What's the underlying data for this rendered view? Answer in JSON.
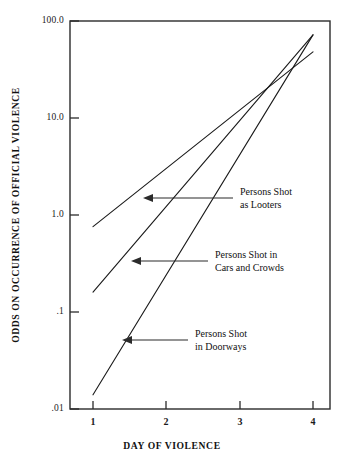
{
  "chart_data": {
    "type": "line",
    "title": "",
    "xlabel": "DAY OF VIOLENCE",
    "ylabel": "ODDS ON OCCURRENCE OF OFFICIAL VIOLENCE",
    "yscale": "log",
    "ylim": [
      0.01,
      100.0
    ],
    "xlim": [
      0.72,
      4.28
    ],
    "grid": false,
    "legend_position": "inline-annotations",
    "x": [
      1,
      2,
      3,
      4
    ],
    "xticks": [
      "1",
      "2",
      "3",
      "4"
    ],
    "yticks": [
      "100.0",
      "10.0",
      "1.0",
      ".1",
      ".01"
    ],
    "ytick_values": [
      100.0,
      10.0,
      1.0,
      0.1,
      0.01
    ],
    "series": [
      {
        "name": "Persons Shot as Looters",
        "x": [
          1,
          4
        ],
        "values": [
          0.76,
          48.0
        ]
      },
      {
        "name": "Persons Shot in Cars and Crowds",
        "x": [
          1,
          4
        ],
        "values": [
          0.16,
          72.0
        ]
      },
      {
        "name": "Persons Shot in Doorways",
        "x": [
          1,
          4
        ],
        "values": [
          0.014,
          72.0
        ]
      }
    ],
    "annotations": [
      {
        "label_line1": "Persons Shot",
        "label_line2": "as Looters",
        "target_series": "Persons Shot as Looters"
      },
      {
        "label_line1": "Persons Shot in",
        "label_line2": "Cars and Crowds",
        "target_series": "Persons Shot in Cars and Crowds"
      },
      {
        "label_line1": "Persons Shot",
        "label_line2": "in Doorways",
        "target_series": "Persons Shot in Doorways"
      }
    ]
  },
  "axes": {
    "y_title": "ODDS ON OCCURRENCE OF OFFICIAL VIOLENCE",
    "x_title": "DAY OF VIOLENCE",
    "y_labels": [
      "100.0",
      "10.0",
      "1.0",
      ".1",
      ".01"
    ],
    "x_labels": [
      "1",
      "2",
      "3",
      "4"
    ]
  },
  "annotations": {
    "looters": {
      "line1": "Persons Shot",
      "line2": "as Looters"
    },
    "cars": {
      "line1": "Persons Shot in",
      "line2": "Cars and Crowds"
    },
    "doorways": {
      "line1": "Persons Shot",
      "line2": "in Doorways"
    }
  },
  "colors": {
    "ink": "#1a1a1a",
    "axis": "#2b2b2b",
    "background": "#ffffff"
  }
}
